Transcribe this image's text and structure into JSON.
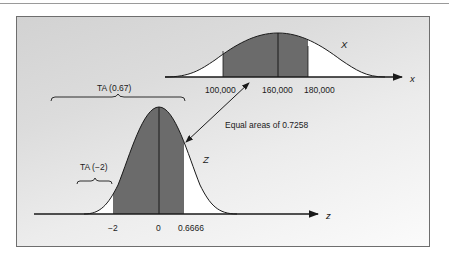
{
  "figure": {
    "upper_distribution": {
      "variable_label": "X",
      "axis_label": "x",
      "tick_labels": [
        "100,000",
        "160,000",
        "180,000"
      ]
    },
    "lower_distribution": {
      "variable_label": "Z",
      "axis_label": "z",
      "tick_labels": [
        "−2",
        "0",
        "0.6666"
      ]
    },
    "annotations": {
      "brace_upper": "TA (0.67)",
      "brace_lower": "TA (−2)",
      "equal_areas": "Equal areas of 0.7258"
    },
    "colors": {
      "shaded_area": "#6b6b6b",
      "tail_area": "#ffffff",
      "line": "#1a1a1a",
      "frame_border": "#6e6e6e"
    }
  }
}
